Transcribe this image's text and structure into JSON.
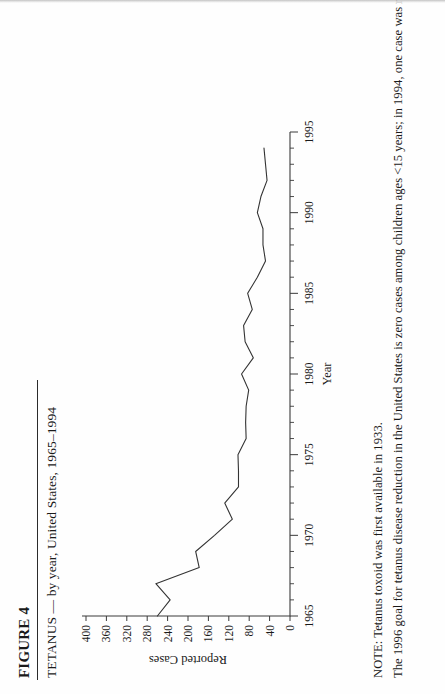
{
  "figure": {
    "label": "FIGURE 4",
    "title": "TETANUS  — by year, United States, 1965–1994"
  },
  "notes": [
    "NOTE: Tetanus toxoid was first available in 1933.",
    "The 1996 goal for tetanus disease reduction in the United States is zero cases among children ages <15 years; in 1994, one case was reported"
  ],
  "chart_data": {
    "type": "line",
    "title": "TETANUS  — by year, United States, 1965–1994",
    "xlabel": "Year",
    "ylabel": "Reported Cases",
    "xlim": [
      1965,
      1995
    ],
    "ylim": [
      0,
      400
    ],
    "xticks": [
      1965,
      1970,
      1975,
      1980,
      1985,
      1990,
      1995
    ],
    "xtick_labels": [
      "1965",
      "1970",
      "1975",
      "1980",
      "1985",
      "1990",
      "1995"
    ],
    "xtick_minor_step": 1,
    "yticks": [
      0,
      40,
      80,
      120,
      160,
      200,
      240,
      280,
      320,
      360,
      400
    ],
    "ytick_labels": [
      "0",
      "40",
      "80",
      "120",
      "160",
      "200",
      "240",
      "280",
      "320",
      "360",
      "400"
    ],
    "grid": false,
    "legend": false,
    "series": [
      {
        "name": "Reported tetanus cases",
        "x": [
          1965,
          1966,
          1967,
          1968,
          1969,
          1970,
          1971,
          1972,
          1973,
          1974,
          1975,
          1976,
          1977,
          1978,
          1979,
          1980,
          1981,
          1982,
          1983,
          1984,
          1985,
          1986,
          1987,
          1988,
          1989,
          1990,
          1991,
          1992,
          1993,
          1994
        ],
        "values": [
          260,
          235,
          263,
          178,
          185,
          148,
          113,
          128,
          101,
          101,
          102,
          86,
          87,
          86,
          81,
          95,
          72,
          88,
          91,
          74,
          83,
          64,
          48,
          53,
          53,
          64,
          57,
          45,
          48,
          51
        ]
      }
    ]
  }
}
